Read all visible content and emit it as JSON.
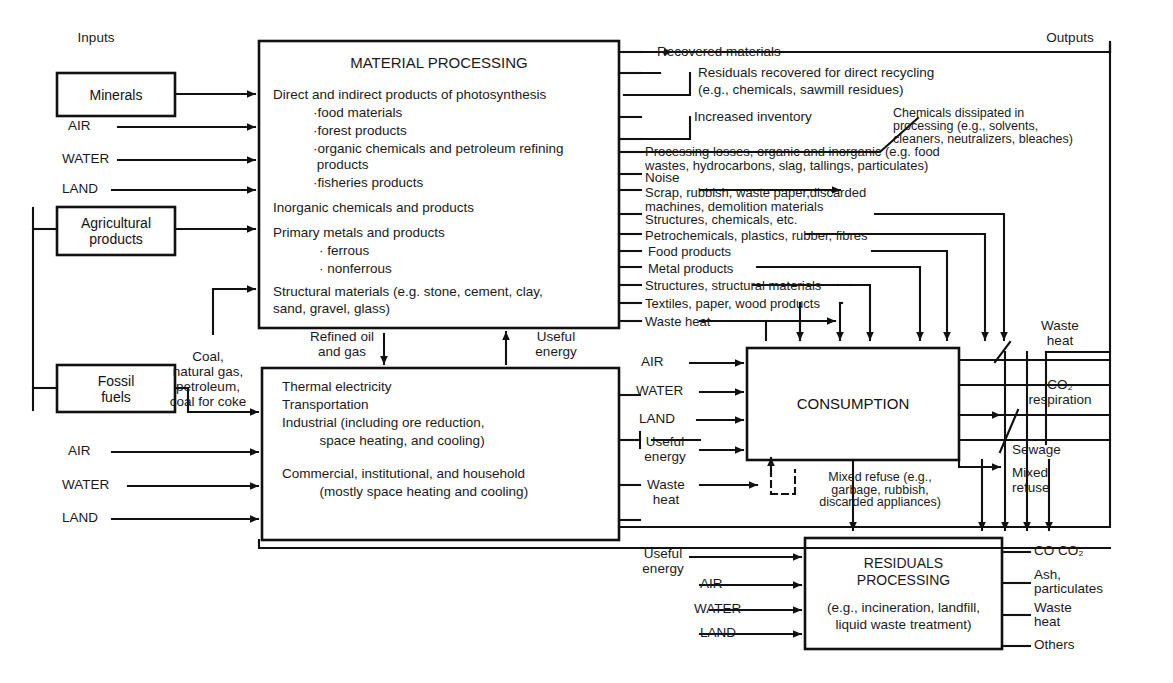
{
  "diagram": {
    "title_left": "Inputs",
    "title_right": "Outputs",
    "input_boxes": [
      {
        "id": "minerals",
        "label": "Minerals"
      },
      {
        "id": "agricultural",
        "label": "Agricultural\nproducts"
      },
      {
        "id": "fossil",
        "label": "Fossil\nfuels"
      }
    ],
    "input_flows_top": [
      "AIR",
      "WATER",
      "LAND"
    ],
    "input_flows_bottom": [
      "AIR",
      "WATER",
      "LAND"
    ],
    "material_processing": {
      "header": "MATERIAL PROCESSING",
      "lines": [
        "Direct and indirect products of photosynthesis",
        "·food materials",
        "·forest products",
        "·organic chemicals and petroleum refining",
        " products",
        "·fisheries products",
        "Inorganic chemicals and products",
        "Primary metals and products",
        "· ferrous",
        "· nonferrous",
        "Structural materials (e.g. stone, cement, clay,",
        "sand, gravel, glass)"
      ]
    },
    "energy_conversion": {
      "lines": [
        "Thermal electricity",
        "Transportation",
        "Industrial (including ore reduction,",
        "          space heating, and cooling)",
        "",
        "Commercial, institutional, and household",
        "          (mostly space heating and cooling)"
      ]
    },
    "consumption": {
      "header": "CONSUMPTION"
    },
    "residuals": {
      "header_line1": "RESIDUALS",
      "header_line2": "PROCESSING",
      "body_line1": "(e.g., incineration, landfill,",
      "body_line2": "liquid waste treatment)"
    },
    "fuel_label": "Coal,\nnatural gas,\npetroleum,\ncoal for coke",
    "refined_label": "Refined oil\nand gas",
    "useful_energy_up": "Useful\nenergy",
    "outputs_mp": [
      "Recovered materials",
      "Residuals recovered for direct recycling",
      "(e.g., chemicals, sawmill residues)",
      "Increased inventory",
      "Processing losses, organic and inorganic (e.g. food",
      "wastes, hydrocarbons, slag, tallings, particulates)",
      "Noise",
      "Scrap, rubbish, waste paper,discarded",
      "machines, demolition materials",
      "Structures, chemicals, etc.",
      "Petrochemicals, plastics, rubber, fibres",
      "Food products",
      "Metal products",
      "Structures, structural materials",
      "Textiles, paper, wood products",
      "Waste heat"
    ],
    "chemicals_dissipated": "Chemicals dissipated in\nprocessing (e.g., solvents,\ncleaners, neutralizers, bleaches)",
    "consumption_inputs": [
      "AIR",
      "WATER",
      "LAND",
      "Useful\nenergy",
      "Waste\nheat"
    ],
    "mixed_refuse_note": "Mixed refuse (e.g.,\ngarbage, rubbish,\ndiscarded appliances)",
    "consumption_outputs": [
      "Waste\nheat",
      "CO₂\nrespiration",
      "Sewage",
      "Mixed\nrefuse"
    ],
    "residuals_inputs": [
      "Useful\nenergy",
      "AIR",
      "WATER",
      "LAND"
    ],
    "residuals_outputs": [
      "CO CO₂",
      "Ash,\nparticulates",
      "Waste\nheat",
      "Others"
    ],
    "colors": {
      "ink": "#111111",
      "paper": "#ffffff"
    }
  }
}
